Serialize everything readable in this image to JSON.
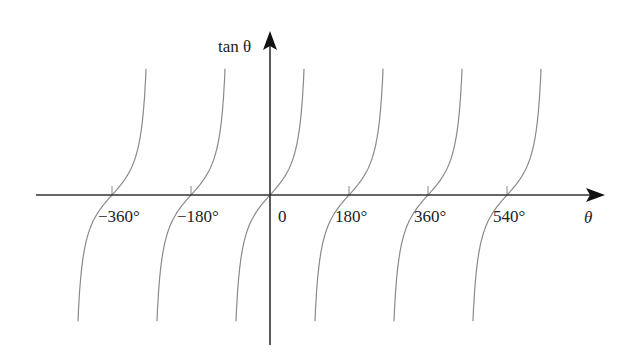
{
  "chart_data": {
    "type": "line",
    "title": "",
    "function": "tan θ",
    "xlabel": "θ",
    "ylabel": "tan θ",
    "x_unit": "degrees",
    "xticks": [
      {
        "value": -360,
        "label": "−360°"
      },
      {
        "value": -180,
        "label": "−180°"
      },
      {
        "value": 0,
        "label": "0"
      },
      {
        "value": 180,
        "label": "180°"
      },
      {
        "value": 360,
        "label": "360°"
      },
      {
        "value": 540,
        "label": "540°"
      }
    ],
    "xlim": [
      -550,
      720
    ],
    "ylim": [
      -4,
      4
    ],
    "grid": false,
    "legend": null,
    "branches": [
      {
        "center": -360,
        "from": -450,
        "to": -270
      },
      {
        "center": -180,
        "from": -270,
        "to": -90
      },
      {
        "center": 0,
        "from": -90,
        "to": 90
      },
      {
        "center": 180,
        "from": 90,
        "to": 270
      },
      {
        "center": 360,
        "from": 270,
        "to": 450
      },
      {
        "center": 540,
        "from": 450,
        "to": 630
      }
    ],
    "series": [
      {
        "name": "tan θ",
        "x": [
          -85,
          -60,
          -45,
          -30,
          0,
          30,
          45,
          60,
          85
        ],
        "values": [
          -11.43,
          -1.73,
          -1.0,
          -0.58,
          0,
          0.58,
          1.0,
          1.73,
          11.43
        ]
      }
    ],
    "colors": {
      "axis": "#333333",
      "curve": "#8a8a8a",
      "text": "#222222"
    }
  },
  "labels": {
    "y_axis": "tan θ",
    "x_axis": "θ",
    "ticks": [
      "−360°",
      "−180°",
      "0",
      "180°",
      "360°",
      "540°"
    ]
  }
}
